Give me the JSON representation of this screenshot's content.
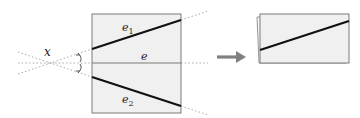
{
  "diagram": {
    "labels": {
      "x": "x",
      "e": "e",
      "e1_base": "e",
      "e1_sub": "1",
      "e2_base": "e",
      "e2_sub": "2"
    },
    "colors": {
      "box_fill": "#f0f0f0",
      "box_stroke": "#7a7a7a",
      "thick_line": "#111111",
      "dotted": "#9a9a9a",
      "arrow": "#808080"
    },
    "arrow_icon": "right-arrow-icon"
  }
}
